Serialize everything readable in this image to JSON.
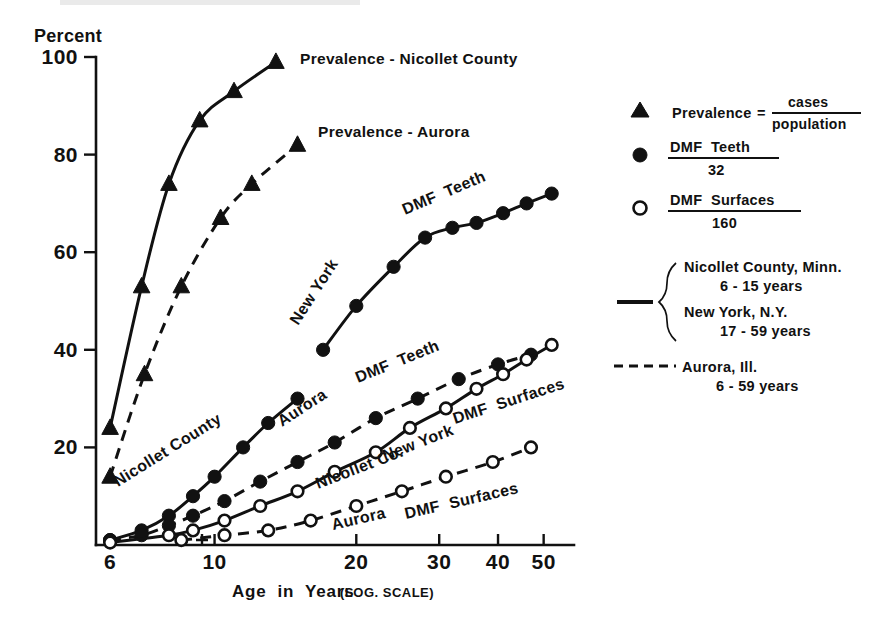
{
  "figure": {
    "y_axis_caption": "Percent",
    "x_axis_title_main": "Age  in  Years",
    "x_axis_title_note": "(LOG. SCALE)"
  },
  "axes": {
    "y_ticks": [
      "20",
      "40",
      "60",
      "80",
      "100"
    ],
    "x_ticks": [
      "6",
      "10",
      "20",
      "30",
      "40",
      "50"
    ]
  },
  "inline_annotations": {
    "prevalence_nicollet": "Prevalence - Nicollet County",
    "prevalence_aurora": "Prevalence - Aurora",
    "nicollet_county": "Nicollet County",
    "new_york_teeth": "New York",
    "dmf_teeth_ny": "DMF  Teeth",
    "aurora_teeth": "Aurora",
    "dmf_teeth_aurora": "DMF  Teeth",
    "nicollet_co_surfaces": "Nicollet Co.",
    "new_york_surfaces": "New York",
    "dmf_surfaces_ny": "DMF  Surfaces",
    "aurora_surfaces": "Aurora",
    "dmf_surfaces_aurora": "DMF  Surfaces"
  },
  "legend": {
    "items": [
      {
        "marker": "filled-triangle-marker",
        "label": "Prevalence",
        "equals": "=",
        "numerator": "cases",
        "denominator": "population"
      },
      {
        "marker": "filled-circle-marker",
        "numerator": "DMF  Teeth",
        "denominator": "32"
      },
      {
        "marker": "open-circle-marker",
        "numerator": "DMF  Surfaces",
        "denominator": "160"
      }
    ],
    "line_styles": [
      {
        "marker": "solid-line-swatch",
        "rows": [
          {
            "place": "Nicollet County, Minn.",
            "ages": "6 - 15 years"
          },
          {
            "place": "New York, N.Y.",
            "ages": "17 - 59 years"
          }
        ]
      },
      {
        "marker": "dashed-line-swatch",
        "rows": [
          {
            "place": "Aurora, Ill.",
            "ages": "6 - 59 years"
          }
        ]
      }
    ]
  },
  "chart_data": {
    "type": "line",
    "title": "",
    "xlabel": "Age in Years (LOG. SCALE)",
    "ylabel": "Percent",
    "xscale": "log",
    "xlim": [
      5.6,
      58
    ],
    "ylim": [
      0,
      100
    ],
    "grid": false,
    "legend_position": "right",
    "x_tick_values": [
      6,
      10,
      20,
      30,
      40,
      50
    ],
    "y_tick_values": [
      20,
      40,
      60,
      80,
      100
    ],
    "series": [
      {
        "name": "Prevalence - Nicollet County",
        "marker": "filled-triangle",
        "line": "solid",
        "points": [
          [
            6,
            24
          ],
          [
            7,
            53
          ],
          [
            8,
            74
          ],
          [
            9.3,
            87
          ],
          [
            11,
            93
          ],
          [
            13.5,
            99
          ]
        ]
      },
      {
        "name": "Prevalence - Aurora",
        "marker": "filled-triangle",
        "line": "dashed",
        "points": [
          [
            6,
            14
          ],
          [
            7.1,
            35
          ],
          [
            8.5,
            53
          ],
          [
            10.3,
            67
          ],
          [
            12,
            74
          ],
          [
            15,
            82
          ]
        ]
      },
      {
        "name": "Nicollet County DMF Teeth",
        "marker": "filled-circle",
        "line": "solid",
        "points": [
          [
            6,
            1
          ],
          [
            7,
            3
          ],
          [
            8,
            6
          ],
          [
            9,
            10
          ],
          [
            10,
            14
          ],
          [
            11.5,
            20
          ],
          [
            13,
            25
          ],
          [
            15,
            30
          ]
        ]
      },
      {
        "name": "New York DMF Teeth",
        "marker": "filled-circle",
        "line": "solid",
        "points": [
          [
            17,
            40
          ],
          [
            20,
            49
          ],
          [
            24,
            57
          ],
          [
            28,
            63
          ],
          [
            32,
            65
          ],
          [
            36,
            66
          ],
          [
            41,
            68
          ],
          [
            46,
            70
          ],
          [
            52,
            72
          ]
        ]
      },
      {
        "name": "Aurora DMF Teeth",
        "marker": "filled-circle",
        "line": "dashed",
        "points": [
          [
            6,
            1
          ],
          [
            7,
            2
          ],
          [
            8,
            4
          ],
          [
            9,
            6
          ],
          [
            10.5,
            9
          ],
          [
            12.5,
            13
          ],
          [
            15,
            17
          ],
          [
            18,
            21
          ],
          [
            22,
            26
          ],
          [
            27,
            30
          ],
          [
            33,
            34
          ],
          [
            40,
            37
          ],
          [
            47,
            39
          ]
        ]
      },
      {
        "name": "Nicollet Co. / New York DMF Surfaces",
        "marker": "open-circle",
        "line": "solid",
        "points": [
          [
            6,
            0.5
          ],
          [
            8,
            2
          ],
          [
            9,
            3
          ],
          [
            10.5,
            5
          ],
          [
            12.5,
            8
          ],
          [
            15,
            11
          ],
          [
            18,
            15
          ],
          [
            22,
            19
          ],
          [
            26,
            24
          ],
          [
            31,
            28
          ],
          [
            36,
            32
          ],
          [
            41,
            35
          ],
          [
            46,
            38
          ],
          [
            52,
            41
          ]
        ]
      },
      {
        "name": "Aurora DMF Surfaces",
        "marker": "open-circle",
        "line": "dashed",
        "points": [
          [
            8.5,
            1
          ],
          [
            10.5,
            2
          ],
          [
            13,
            3
          ],
          [
            16,
            5
          ],
          [
            20,
            8
          ],
          [
            25,
            11
          ],
          [
            31,
            14
          ],
          [
            39,
            17
          ],
          [
            47,
            20
          ]
        ]
      }
    ]
  }
}
